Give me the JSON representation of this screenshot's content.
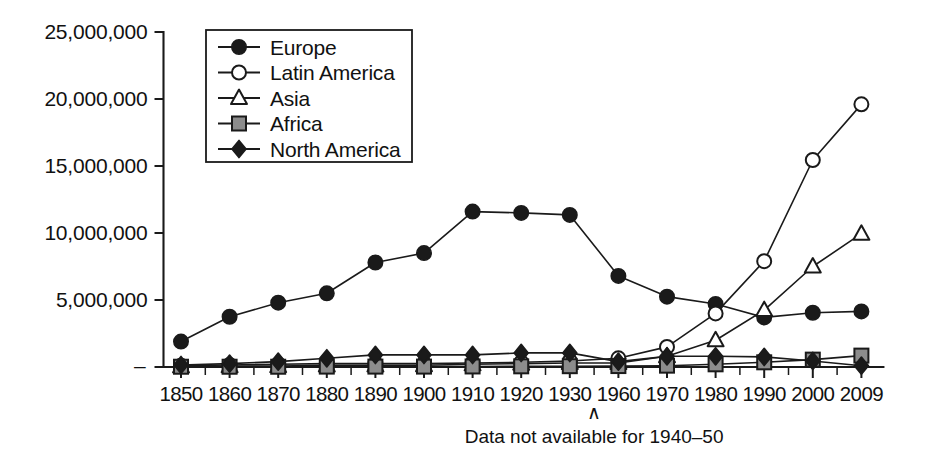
{
  "chart_data": {
    "type": "line",
    "title": "",
    "subtitle": "",
    "xlabel": "",
    "ylabel": "",
    "categories": [
      "1850",
      "1860",
      "1870",
      "1880",
      "1890",
      "1900",
      "1910",
      "1920",
      "1930",
      "1960",
      "1970",
      "1980",
      "1990",
      "2000",
      "2009"
    ],
    "ylim": [
      0,
      25000000
    ],
    "ytick_values": [
      0,
      5000000,
      10000000,
      15000000,
      20000000,
      25000000
    ],
    "ytick_labels": [
      "–",
      "5,000,000",
      "10,000,000",
      "15,000,000",
      "20,000,000",
      "25,000,000"
    ],
    "grid": false,
    "legend_position": "top-left",
    "annotation": {
      "caret": "∧",
      "text": "Data not available for 1940–50",
      "anchor_category_gap": "1930-1960"
    },
    "series": [
      {
        "name": "Europe",
        "marker": "filled-circle",
        "marker_fill": "#1a1a1a",
        "values": [
          1900000,
          3750000,
          4800000,
          5500000,
          7800000,
          8500000,
          11600000,
          11500000,
          11350000,
          6800000,
          5250000,
          4700000,
          3700000,
          4050000,
          4150000
        ]
      },
      {
        "name": "Latin America",
        "marker": "open-circle",
        "marker_fill": "#ffffff",
        "values": [
          100000,
          150000,
          200000,
          250000,
          250000,
          250000,
          300000,
          350000,
          450000,
          650000,
          1500000,
          4000000,
          7900000,
          15450000,
          19600000
        ]
      },
      {
        "name": "Asia",
        "marker": "open-triangle",
        "marker_fill": "#ffffff",
        "values": [
          50000,
          60000,
          70000,
          120000,
          120000,
          130000,
          200000,
          250000,
          300000,
          300000,
          800000,
          2000000,
          4250000,
          7500000,
          9950000
        ]
      },
      {
        "name": "Africa",
        "marker": "gray-square",
        "marker_fill": "#8c8c8c",
        "values": [
          20000,
          20000,
          20000,
          30000,
          30000,
          30000,
          40000,
          50000,
          60000,
          70000,
          100000,
          200000,
          350000,
          550000,
          850000
        ]
      },
      {
        "name": "North America",
        "marker": "filled-diamond",
        "marker_fill": "#1a1a1a",
        "values": [
          150000,
          250000,
          400000,
          650000,
          900000,
          900000,
          900000,
          1050000,
          1050000,
          400000,
          800000,
          800000,
          750000,
          450000,
          100000
        ]
      }
    ]
  },
  "legend": {
    "entries": [
      {
        "label": "Europe"
      },
      {
        "label": "Latin America"
      },
      {
        "label": "Asia"
      },
      {
        "label": "Africa"
      },
      {
        "label": "North America"
      }
    ]
  },
  "colors": {
    "ink": "#1a1a1a",
    "paper": "#ffffff",
    "africa_gray": "#8c8c8c"
  }
}
